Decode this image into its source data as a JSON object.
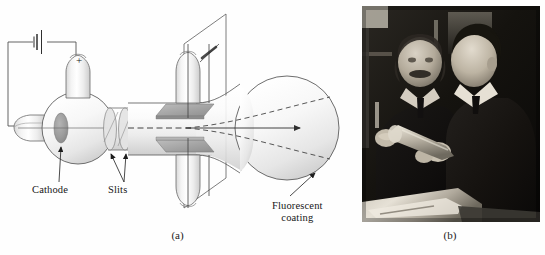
{
  "figure": {
    "panels": [
      {
        "id": "a",
        "caption": "(a)",
        "kind": "line-diagram",
        "subject": "cathode ray tube (Thomson e/m apparatus) schematic",
        "labels": [
          {
            "name": "cathode",
            "text": "Cathode"
          },
          {
            "name": "slits",
            "text": "Slits"
          },
          {
            "name": "fluorescent-coating",
            "text": "Fluorescent",
            "text2": "coating"
          },
          {
            "name": "anode-polarity",
            "text": "+"
          }
        ]
      },
      {
        "id": "b",
        "caption": "(b)",
        "kind": "photograph",
        "subject": "two men in suits examining a glass cathode ray tube in a laboratory",
        "tone": "black-and-white"
      }
    ]
  },
  "colors": {
    "background": "#fefefe",
    "ink": "#3c3c3c",
    "ink_dark": "#161616",
    "glass_light": "#fbfbfb",
    "glass_mid": "#e8e8e8",
    "glass_shade": "#cfcfcf",
    "plate_fill": "#a8a8a8",
    "plate_edge": "#8a8a8a",
    "cathode_disc": "#9b9b9b",
    "photo_dark": "#0d0d0d",
    "photo_mid": "#5a5a5a",
    "photo_light": "#d7d3cb"
  }
}
